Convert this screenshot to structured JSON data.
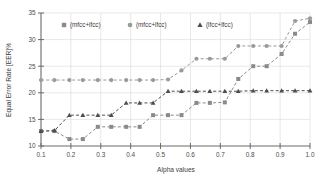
{
  "chart_data": {
    "type": "line",
    "title": "",
    "xlabel": "Alpha values",
    "ylabel": "Equal Error Rate [EER]%",
    "xlim": [
      0.1,
      1.0
    ],
    "ylim": [
      10,
      35
    ],
    "xticks": [
      "0.1",
      "0.2",
      "0.3",
      "0.4",
      "0.5",
      "0.6",
      "0.7",
      "0.8",
      "0.9",
      "1.0"
    ],
    "yticks": [
      "10",
      "15",
      "20",
      "25",
      "30",
      "35"
    ],
    "grid": true,
    "legend_position": "top-left-inside",
    "x": [
      0.1,
      0.145,
      0.195,
      0.24,
      0.29,
      0.335,
      0.385,
      0.43,
      0.475,
      0.525,
      0.57,
      0.62,
      0.665,
      0.715,
      0.76,
      0.81,
      0.855,
      0.905,
      0.95,
      1.0
    ],
    "series": [
      {
        "name": "(mfcc+lfcc)",
        "marker": "square",
        "color": "#8a8a8a",
        "values": [
          12.8,
          12.8,
          11.3,
          11.3,
          13.6,
          13.6,
          13.6,
          13.6,
          15.8,
          15.8,
          15.8,
          18.1,
          18.1,
          18.2,
          22.6,
          25.0,
          25.0,
          27.3,
          31.1,
          33.3
        ]
      },
      {
        "name": "(mfcc+lfcc)",
        "marker": "circle",
        "color": "#9a9a9a",
        "values": [
          22.4,
          22.4,
          22.4,
          22.4,
          22.4,
          22.4,
          22.4,
          22.4,
          22.4,
          22.5,
          24.2,
          26.4,
          26.4,
          26.4,
          28.8,
          28.8,
          28.8,
          28.8,
          33.5,
          34.0
        ]
      },
      {
        "name": "(lfcc+lfcc)",
        "marker": "triangle",
        "color": "#4d4d4d",
        "values": [
          12.8,
          12.9,
          15.8,
          15.8,
          15.8,
          15.8,
          18.1,
          18.1,
          18.1,
          20.3,
          20.3,
          20.3,
          20.3,
          20.3,
          20.3,
          20.4,
          20.4,
          20.4,
          20.4,
          20.4
        ]
      }
    ],
    "legend": [
      {
        "label": "(mfcc+lfcc)",
        "marker": "square",
        "color": "#8a8a8a"
      },
      {
        "label": "(mfcc+lfcc)",
        "marker": "circle",
        "color": "#9a9a9a"
      },
      {
        "label": "(lfcc+lfcc)",
        "marker": "triangle",
        "color": "#4d4d4d"
      }
    ]
  }
}
